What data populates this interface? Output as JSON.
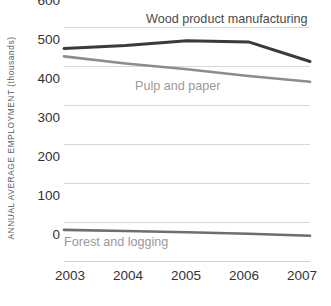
{
  "chart_data": {
    "type": "line",
    "title": "",
    "subtitle": "",
    "xlabel": "",
    "ylabel": "ANNUAL AVERAGE EMPLOYMENT (thousands)",
    "x": [
      "2003",
      "2004",
      "2005",
      "2006",
      "2007"
    ],
    "categories": [
      "2003",
      "2004",
      "2005",
      "2006",
      "2007"
    ],
    "xlim": [
      2003,
      2007
    ],
    "ylim": [
      0,
      600
    ],
    "yticks": [
      0,
      100,
      200,
      300,
      400,
      500,
      600
    ],
    "ytick_labels": [
      "0",
      "100",
      "200",
      "300",
      "400",
      "500",
      "600"
    ],
    "grid": true,
    "grid_axis": "y",
    "legend": "inline-labels",
    "series": [
      {
        "name": "Wood product manufacturing",
        "values": [
          545,
          553,
          565,
          562,
          512
        ],
        "color": "#3a3a3a",
        "width": 3.0,
        "label_x": "2005",
        "label_position": "above-line"
      },
      {
        "name": "Pulp and paper",
        "values": [
          525,
          507,
          492,
          475,
          460
        ],
        "color": "#8c8c8c",
        "width": 2.6,
        "label_x": "2004",
        "label_position": "below-line"
      },
      {
        "name": "Forest and logging",
        "values": [
          82,
          79,
          76,
          72,
          67
        ],
        "color": "#6e6e6e",
        "width": 2.6,
        "label_x": "2003",
        "label_position": "below-line"
      }
    ],
    "annotations": [
      {
        "text": "Wood product manufacturing",
        "color": "#4a4a4a"
      },
      {
        "text": "Pulp and paper",
        "color": "#9a9a9a"
      },
      {
        "text": "Forest and logging",
        "color": "#9a9a9a"
      }
    ]
  },
  "axes": {
    "y_title": "ANNUAL AVERAGE EMPLOYMENT (thousands)",
    "y_ticks": [
      "600",
      "500",
      "400",
      "300",
      "200",
      "100",
      "0"
    ],
    "x_ticks": [
      "2003",
      "2004",
      "2005",
      "2006",
      "2007"
    ]
  },
  "labels": {
    "wood": "Wood product manufacturing",
    "pulp": "Pulp and paper",
    "forest": "Forest and logging"
  },
  "colors": {
    "wood_line": "#3a3a3a",
    "pulp_line": "#8c8c8c",
    "forest_line": "#6e6e6e",
    "gridline": "#d8d8d8",
    "tick_text": "#333333",
    "axis_title": "#5c5c5c",
    "background": "#ffffff"
  }
}
